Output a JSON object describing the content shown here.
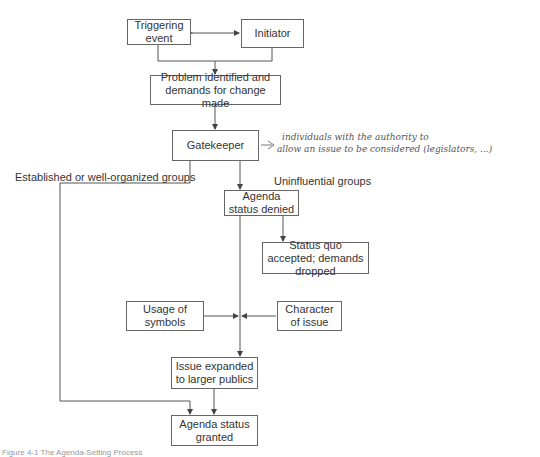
{
  "nodes": {
    "triggering_event": "Triggering event",
    "initiator": "Initiator",
    "problem_identified": "Problem identified and demands for change made",
    "gatekeeper": "Gatekeeper",
    "agenda_denied": "Agenda status denied",
    "status_quo": "Status quo accepted; demands dropped",
    "usage_symbols": "Usage of symbols",
    "character_issue": "Character of issue",
    "issue_expanded": "Issue expanded to larger publics",
    "agenda_granted": "Agenda status granted"
  },
  "edge_labels": {
    "established": "Established or well-organized groups",
    "uninfluential": "Uninfluential groups"
  },
  "annotation": {
    "line1": "individuals with the authority to",
    "line2": "allow an issue to be considered (legislators, ...)"
  },
  "caption": "Figure 4-1 The Agenda-Setting Process"
}
